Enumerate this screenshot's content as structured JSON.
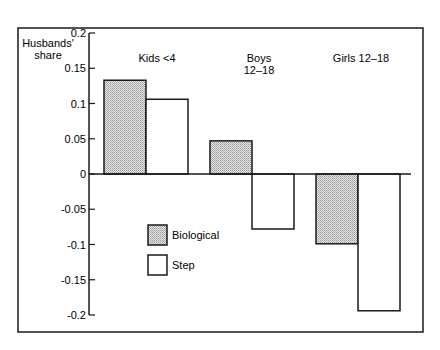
{
  "chart_data": {
    "type": "bar",
    "title": "",
    "xlabel": "",
    "ylabel": "Husbands' share",
    "ylabel_lines": [
      "Husbands'",
      "share"
    ],
    "ylim": [
      -0.2,
      0.2
    ],
    "yticks": [
      0.2,
      0.15,
      0.1,
      0.05,
      0,
      -0.05,
      -0.1,
      -0.15,
      -0.2
    ],
    "ytick_labels": [
      "0.2",
      "0.15",
      "0.1",
      "0.05",
      "0",
      "-0.05",
      "-0.1",
      "-0.15",
      "-0.2"
    ],
    "grid": false,
    "categories": [
      "Kids <4",
      "Boys 12–18",
      "Girls 12–18"
    ],
    "category_label_lines": [
      [
        "Kids <4"
      ],
      [
        "Boys",
        "12–18"
      ],
      [
        "Girls 12–18"
      ]
    ],
    "series": [
      {
        "name": "Biological",
        "values": [
          0.133,
          0.047,
          -0.099
        ],
        "fill": "pattern-gray-dots"
      },
      {
        "name": "Step",
        "values": [
          0.106,
          -0.078,
          -0.194
        ],
        "fill": "#ffffff"
      }
    ],
    "legend": {
      "position": "inside-lower-left",
      "entries": [
        "Biological",
        "Step"
      ]
    }
  },
  "colors": {
    "frame": "#1a1a1a",
    "bar_stroke": "#1a1a1a",
    "pattern_light": "#e6e6e6",
    "pattern_dark": "#9a9a9a"
  }
}
